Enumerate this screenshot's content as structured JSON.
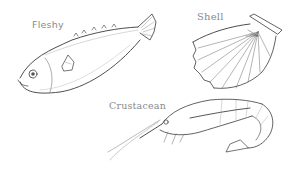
{
  "illustration": {
    "style": "pencil-sketch",
    "stroke_color": "#3a3a3a",
    "label_color": "#8a8a8a",
    "background": "#ffffff",
    "labels": {
      "fleshy": "Fleshy",
      "shell": "Shell",
      "crustacean": "Crustacean"
    },
    "subjects": [
      {
        "name": "fish",
        "label": "Fleshy"
      },
      {
        "name": "scallop-shell",
        "label": "Shell"
      },
      {
        "name": "shrimp",
        "label": "Crustacean"
      }
    ]
  }
}
